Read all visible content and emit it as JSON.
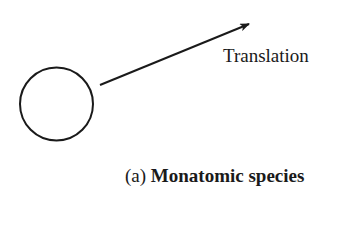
{
  "diagram": {
    "motion_label": "Translation",
    "caption": {
      "prefix": "(a)",
      "title": "Monatomic species"
    },
    "colors": {
      "stroke": "#1a1a1a",
      "background": "#ffffff"
    }
  }
}
